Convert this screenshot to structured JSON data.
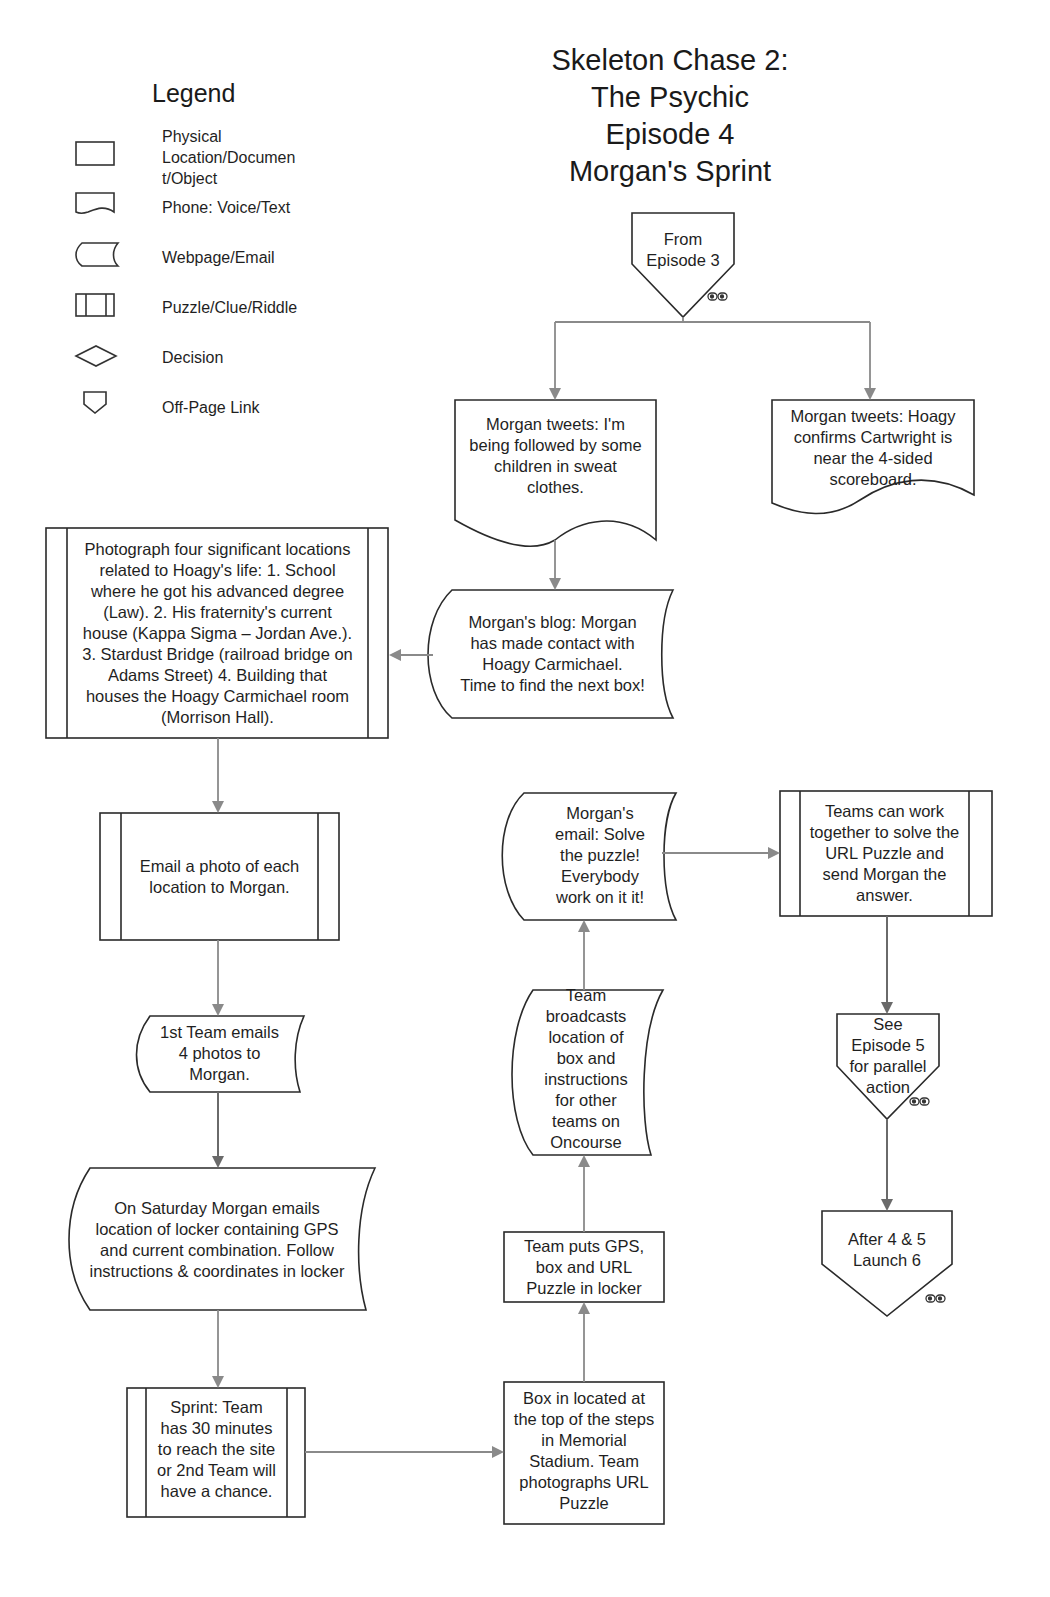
{
  "title": {
    "line1": "Skeleton Chase 2:",
    "line2": "The Psychic",
    "line3": "Episode 4",
    "line4": "Morgan's Sprint"
  },
  "legend": {
    "title": "Legend",
    "items": [
      {
        "shape": "rectangle",
        "label_l1": "Physical",
        "label_l2": "Location/Documen",
        "label_l3": "t/Object"
      },
      {
        "shape": "document-wave",
        "label": "Phone: Voice/Text"
      },
      {
        "shape": "stored-data",
        "label": "Webpage/Email"
      },
      {
        "shape": "predefined-process",
        "label": "Puzzle/Clue/Riddle"
      },
      {
        "shape": "diamond",
        "label": "Decision"
      },
      {
        "shape": "off-page-connector",
        "label": "Off-Page Link"
      }
    ]
  },
  "nodes": {
    "from_ep3": {
      "type": "off-page-link",
      "l1": "From",
      "l2": "Episode 3"
    },
    "tweet_followed": {
      "type": "phone",
      "l1": "Morgan tweets: I'm",
      "l2": "being followed by some",
      "l3": "children in sweat",
      "l4": "clothes."
    },
    "tweet_hoagy": {
      "type": "phone",
      "l1": "Morgan tweets: Hoagy",
      "l2": "confirms Cartwright is",
      "l3": "near the 4-sided",
      "l4": "scoreboard."
    },
    "blog": {
      "type": "webpage",
      "l1": "Morgan's blog: Morgan",
      "l2": "has made contact with",
      "l3": "Hoagy Carmichael.",
      "l4": "Time to find the next box!"
    },
    "photograph": {
      "type": "puzzle",
      "l1": "Photograph four significant locations",
      "l2": "related to  Hoagy's life: 1. School",
      "l3": "where he got his advanced degree",
      "l4": "(Law). 2. His fraternity's current",
      "l5": "house (Kappa Sigma – Jordan Ave.).",
      "l6": "3. Stardust Bridge (railroad bridge on",
      "l7": "Adams Street) 4. Building that",
      "l8": "houses the Hoagy Carmichael room",
      "l9": "(Morrison Hall)."
    },
    "email_photo": {
      "type": "puzzle",
      "l1": "Email a photo of each",
      "l2": "location to Morgan."
    },
    "first_team": {
      "type": "webpage",
      "l1": "1st Team emails",
      "l2": "4 photos to",
      "l3": "Morgan."
    },
    "saturday": {
      "type": "webpage",
      "l1": "On Saturday Morgan emails",
      "l2": "location of locker containing GPS",
      "l3": "and current combination. Follow",
      "l4": "instructions & coordinates in locker"
    },
    "sprint": {
      "type": "puzzle",
      "l1": "Sprint: Team",
      "l2": "has 30 minutes",
      "l3": "to reach the site",
      "l4": "or 2nd Team will",
      "l5": "have a chance."
    },
    "box_located": {
      "type": "location",
      "l1": "Box in located at",
      "l2": "the top of the steps",
      "l3": "in Memorial",
      "l4": "Stadium. Team",
      "l5": "photographs URL",
      "l6": "Puzzle"
    },
    "team_puts": {
      "type": "location",
      "l1": "Team puts GPS,",
      "l2": "box and URL",
      "l3": "Puzzle in locker"
    },
    "broadcast": {
      "type": "webpage",
      "l1": "Team",
      "l2": "broadcasts",
      "l3": "location of",
      "l4": "box and",
      "l5": "instructions",
      "l6": "for other",
      "l7": "teams on",
      "l8": "Oncourse"
    },
    "morgan_email": {
      "type": "webpage",
      "l1": "Morgan's",
      "l2": "email: Solve",
      "l3": "the puzzle!",
      "l4": "Everybody",
      "l5": "work on it it!"
    },
    "teams_work": {
      "type": "puzzle",
      "l1": "Teams can work",
      "l2": "together to solve the",
      "l3": "URL Puzzle and",
      "l4": "send Morgan the",
      "l5": "answer."
    },
    "see_ep5": {
      "type": "off-page-link",
      "l1": "See",
      "l2": "Episode 5",
      "l3": "for parallel",
      "l4": "action"
    },
    "launch6": {
      "type": "off-page-link",
      "l1": "After 4 & 5",
      "l2": "Launch 6"
    }
  },
  "colors": {
    "stroke": "#2a2a2a",
    "arrow": "#8a8a8a",
    "background": "#ffffff"
  }
}
